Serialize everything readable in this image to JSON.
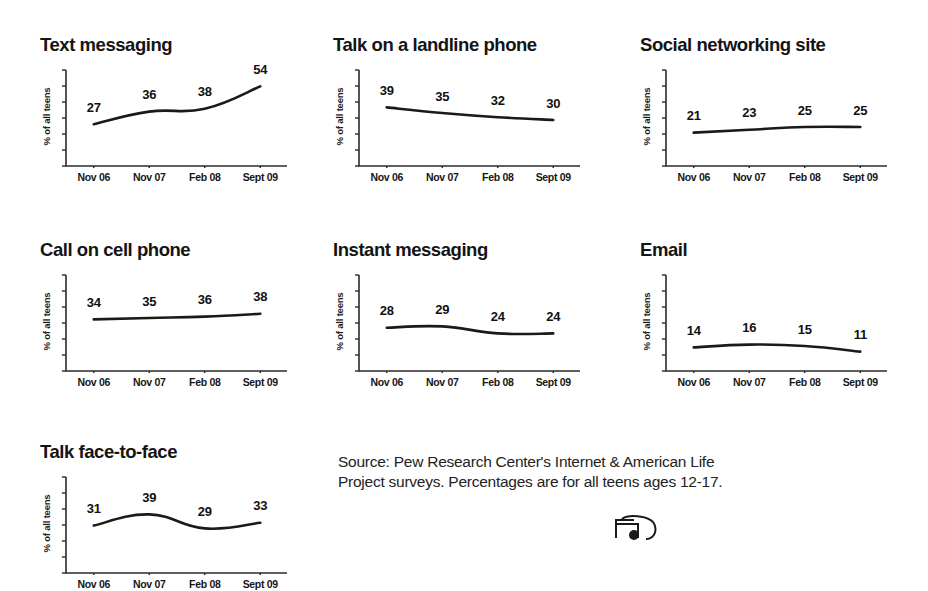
{
  "figure": {
    "background": "#ffffff",
    "line_color": "#1a1a1a",
    "text_color": "#141414",
    "axis_color": "#2b2b2b"
  },
  "source": {
    "text": "Source: Pew Research Center's Internet & American Life\nProject surveys. Percentages are for all teens ages 12-17."
  },
  "logo": {
    "name": "pew-logo-partial"
  },
  "common": {
    "ylabel": "% of all teens",
    "categories": [
      "Nov 06",
      "Nov 07",
      "Feb 08",
      "Sept 09"
    ]
  },
  "chart_data": [
    {
      "type": "line",
      "title": "Text messaging",
      "categories": [
        "Nov 06",
        "Nov 07",
        "Feb 08",
        "Sept 09"
      ],
      "values": [
        27,
        36,
        38,
        54
      ],
      "labels": [
        "27",
        "36",
        "38",
        "54"
      ],
      "xlabel": "",
      "ylabel": "% of all teens",
      "ylim": [
        0,
        60
      ],
      "grid": false,
      "legend": "none"
    },
    {
      "type": "line",
      "title": "Talk on a landline phone",
      "categories": [
        "Nov 06",
        "Nov 07",
        "Feb 08",
        "Sept 09"
      ],
      "values": [
        39,
        35,
        32,
        30
      ],
      "labels": [
        "39",
        "35",
        "32",
        "30"
      ],
      "xlabel": "",
      "ylabel": "% of all teens",
      "ylim": [
        0,
        60
      ],
      "grid": false,
      "legend": "none"
    },
    {
      "type": "line",
      "title": "Social networking site",
      "categories": [
        "Nov 06",
        "Nov 07",
        "Feb 08",
        "Sept 09"
      ],
      "values": [
        21,
        23,
        25,
        25
      ],
      "labels": [
        "21",
        "23",
        "25",
        "25"
      ],
      "xlabel": "",
      "ylabel": "% of all teens",
      "ylim": [
        0,
        60
      ],
      "grid": false,
      "legend": "none"
    },
    {
      "type": "line",
      "title": "Call on cell phone",
      "categories": [
        "Nov 06",
        "Nov 07",
        "Feb 08",
        "Sept 09"
      ],
      "values": [
        34,
        35,
        36,
        38
      ],
      "labels": [
        "34",
        "35",
        "36",
        "38"
      ],
      "xlabel": "",
      "ylabel": "% of all teens",
      "ylim": [
        0,
        60
      ],
      "grid": false,
      "legend": "none"
    },
    {
      "type": "line",
      "title": "Instant messaging",
      "categories": [
        "Nov 06",
        "Nov 07",
        "Feb 08",
        "Sept 09"
      ],
      "values": [
        28,
        29,
        24,
        24
      ],
      "labels": [
        "28",
        "29",
        "24",
        "24"
      ],
      "xlabel": "",
      "ylabel": "% of all teens",
      "ylim": [
        0,
        60
      ],
      "grid": false,
      "legend": "none"
    },
    {
      "type": "line",
      "title": "Email",
      "categories": [
        "Nov 06",
        "Nov 07",
        "Feb 08",
        "Sept 09"
      ],
      "values": [
        14,
        16,
        15,
        11
      ],
      "labels": [
        "14",
        "16",
        "15",
        "11"
      ],
      "xlabel": "",
      "ylabel": "% of all teens",
      "ylim": [
        0,
        60
      ],
      "grid": false,
      "legend": "none"
    },
    {
      "type": "line",
      "title": "Talk face-to-face",
      "categories": [
        "Nov 06",
        "Nov 07",
        "Feb 08",
        "Sept 09"
      ],
      "values": [
        31,
        39,
        29,
        33
      ],
      "labels": [
        "31",
        "39",
        "29",
        "33"
      ],
      "xlabel": "",
      "ylabel": "% of all teens",
      "ylim": [
        0,
        60
      ],
      "grid": false,
      "legend": "none"
    }
  ]
}
